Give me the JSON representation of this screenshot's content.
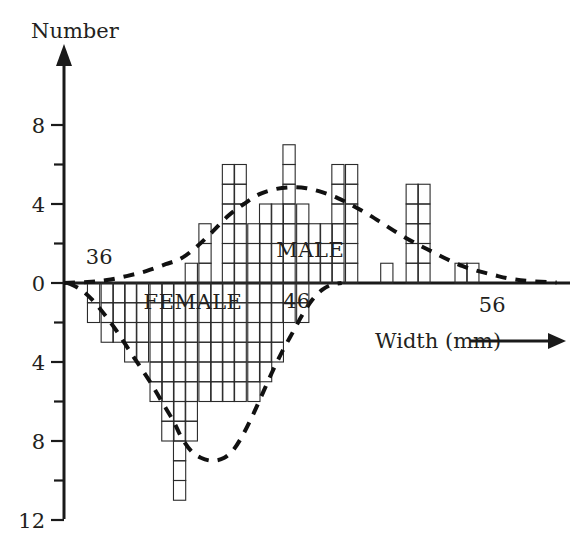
{
  "chart_data": {
    "type": "bar",
    "title": "",
    "subtitle": "",
    "ylabel": "Number",
    "xlabel": "Width (mm)",
    "grid": false,
    "legend_position": "inline-annotations",
    "orientation": "back-to-back-histogram",
    "x_tick_labels": [
      "36",
      "46",
      "56"
    ],
    "x_tick_values": [
      36,
      46,
      56
    ],
    "y_tick_labels_above": [
      "0",
      "4",
      "8"
    ],
    "y_tick_labels_below": [
      "4",
      "8",
      "12"
    ],
    "y_tick_values": [
      8,
      6,
      4,
      2,
      0,
      -2,
      -4,
      -6,
      -8,
      -10,
      -12
    ],
    "y_major_labels": [
      8,
      4,
      0,
      4,
      8,
      12
    ],
    "ylim": [
      -12,
      8
    ],
    "xlim": [
      34.4,
      60.0
    ],
    "bin_width_mm": 0.625,
    "annotations": [
      {
        "text": "MALE",
        "x": 47.0,
        "y": 1.3
      },
      {
        "text": "FEMALE",
        "x": 41.0,
        "y": -1.3
      },
      {
        "text": "36",
        "x": 36.2,
        "y": 0.95
      },
      {
        "text": "46",
        "x": 46.3,
        "y": -1.25
      },
      {
        "text": "56",
        "x": 56.3,
        "y": -1.45
      }
    ],
    "series": [
      {
        "name": "MALE",
        "direction": "up",
        "bins": [
          34.4,
          35.0,
          35.6,
          36.3,
          36.9,
          37.5,
          38.1,
          38.8,
          39.4,
          40.0,
          40.6,
          41.3,
          41.9,
          42.5,
          43.1,
          43.8,
          44.4,
          45.0,
          45.6,
          46.3,
          46.9,
          47.5,
          48.1,
          48.8,
          49.4,
          50.0,
          50.6,
          51.3,
          51.9,
          52.5,
          53.1,
          53.8,
          54.4,
          55.0,
          55.6,
          56.3,
          56.9,
          57.5
        ],
        "values": [
          0,
          0,
          0,
          0,
          0,
          0,
          0,
          0,
          0,
          0,
          1,
          3,
          0,
          6,
          6,
          3,
          4,
          4,
          7,
          4,
          3,
          3,
          6,
          6,
          0,
          0,
          1,
          0,
          5,
          5,
          0,
          0,
          1,
          1,
          0,
          0,
          0,
          0
        ]
      },
      {
        "name": "FEMALE",
        "direction": "down",
        "bins": [
          34.4,
          35.0,
          35.6,
          36.3,
          36.9,
          37.5,
          38.1,
          38.8,
          39.4,
          40.0,
          40.6,
          41.3,
          41.9,
          42.5,
          43.1,
          43.8,
          44.4,
          45.0,
          45.6,
          46.3,
          46.9
        ],
        "values": [
          0,
          0,
          2,
          3,
          3,
          4,
          4,
          6,
          8,
          11,
          8,
          6,
          6,
          6,
          6,
          6,
          5,
          4,
          2,
          2,
          0
        ]
      }
    ],
    "smooth_curves": [
      {
        "name": "MALE frequency polygon (smoothed)",
        "style": "dashed",
        "points": [
          [
            34.4,
            0
          ],
          [
            35.6,
            0.05
          ],
          [
            36.6,
            0.15
          ],
          [
            37.6,
            0.35
          ],
          [
            38.6,
            0.6
          ],
          [
            39.6,
            0.95
          ],
          [
            40.4,
            1.25
          ],
          [
            41.2,
            1.85
          ],
          [
            42.0,
            2.6
          ],
          [
            42.8,
            3.4
          ],
          [
            43.6,
            4.0
          ],
          [
            44.4,
            4.5
          ],
          [
            45.2,
            4.75
          ],
          [
            46.0,
            4.85
          ],
          [
            46.8,
            4.8
          ],
          [
            47.6,
            4.6
          ],
          [
            48.4,
            4.3
          ],
          [
            49.2,
            3.9
          ],
          [
            50.0,
            3.45
          ],
          [
            50.8,
            2.95
          ],
          [
            51.6,
            2.45
          ],
          [
            52.4,
            2.0
          ],
          [
            53.2,
            1.6
          ],
          [
            54.0,
            1.2
          ],
          [
            54.8,
            0.85
          ],
          [
            55.6,
            0.6
          ],
          [
            56.4,
            0.4
          ],
          [
            57.2,
            0.22
          ],
          [
            58.2,
            0.1
          ],
          [
            59.6,
            0.02
          ]
        ]
      },
      {
        "name": "FEMALE frequency polygon (smoothed)",
        "style": "dashed",
        "points": [
          [
            34.6,
            0
          ],
          [
            35.2,
            -0.3
          ],
          [
            35.8,
            -0.8
          ],
          [
            36.4,
            -1.5
          ],
          [
            37.0,
            -2.3
          ],
          [
            37.6,
            -3.2
          ],
          [
            38.2,
            -4.1
          ],
          [
            38.8,
            -5.0
          ],
          [
            39.4,
            -6.0
          ],
          [
            40.0,
            -7.0
          ],
          [
            40.4,
            -7.8
          ],
          [
            40.9,
            -8.5
          ],
          [
            41.4,
            -8.85
          ],
          [
            42.0,
            -9.0
          ],
          [
            42.6,
            -8.85
          ],
          [
            43.1,
            -8.4
          ],
          [
            43.6,
            -7.6
          ],
          [
            44.1,
            -6.6
          ],
          [
            44.6,
            -5.5
          ],
          [
            45.1,
            -4.4
          ],
          [
            45.6,
            -3.4
          ],
          [
            46.1,
            -2.5
          ],
          [
            46.6,
            -1.6
          ],
          [
            47.1,
            -0.85
          ],
          [
            47.6,
            -0.35
          ],
          [
            48.1,
            -0.08
          ],
          [
            48.6,
            0
          ]
        ]
      }
    ]
  },
  "axes": {
    "y_axis_arrow": "arrow-up",
    "x_axis_arrow": "arrow-right",
    "y_label_text": "Number",
    "x_label_text": "Width (mm)"
  },
  "colors": {
    "ink": "#231f20",
    "bar_stroke": "#2b2b2b",
    "curve": "#111111",
    "background": "#ffffff"
  }
}
